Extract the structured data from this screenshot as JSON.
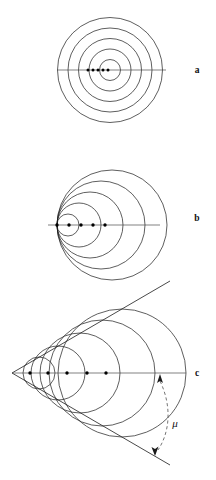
{
  "figure": {
    "background_color": "#ffffff",
    "ink_color": "#1a1a1a",
    "axis_color": "#4a4a4a",
    "width": 216,
    "height": 480
  },
  "panels": [
    {
      "id": "a",
      "label": "a",
      "label_x": 197,
      "label_y": 73,
      "caption_role": "stationary-source-subsonic-zero",
      "axis": {
        "x1": 57,
        "y1": 70,
        "x2": 166,
        "y2": 70
      },
      "center": {
        "x": 110,
        "y": 70
      },
      "circles": [
        {
          "cx": 110,
          "cy": 70,
          "r": 10.5
        },
        {
          "cx": 110,
          "cy": 70,
          "r": 21.0
        },
        {
          "cx": 110,
          "cy": 70,
          "r": 31.5
        },
        {
          "cx": 110,
          "cy": 70,
          "r": 42.0
        },
        {
          "cx": 110,
          "cy": 70,
          "r": 52.5
        }
      ],
      "source_dots": [
        {
          "cx": 88,
          "cy": 70,
          "r": 1.5
        },
        {
          "cx": 93,
          "cy": 70,
          "r": 1.5
        },
        {
          "cx": 98,
          "cy": 70,
          "r": 1.5
        },
        {
          "cx": 103,
          "cy": 70,
          "r": 1.5
        },
        {
          "cx": 108,
          "cy": 70,
          "r": 1.5
        }
      ]
    },
    {
      "id": "b",
      "label": "b",
      "label_x": 197,
      "label_y": 221,
      "caption_role": "sonic-source-mach-one",
      "axis": {
        "x1": 48,
        "y1": 225,
        "x2": 160,
        "y2": 225
      },
      "circles": [
        {
          "cx": 68,
          "cy": 225,
          "r": 11
        },
        {
          "cx": 79,
          "cy": 225,
          "r": 22
        },
        {
          "cx": 90,
          "cy": 225,
          "r": 33
        },
        {
          "cx": 101,
          "cy": 225,
          "r": 44
        },
        {
          "cx": 112,
          "cy": 225,
          "r": 55
        }
      ],
      "source_dots": [
        {
          "cx": 57,
          "cy": 225,
          "r": 1.7
        },
        {
          "cx": 69,
          "cy": 225,
          "r": 1.7
        },
        {
          "cx": 81,
          "cy": 225,
          "r": 1.7
        },
        {
          "cx": 93,
          "cy": 225,
          "r": 1.7
        },
        {
          "cx": 105,
          "cy": 225,
          "r": 1.7
        }
      ]
    },
    {
      "id": "c",
      "label": "c",
      "label_x": 197,
      "label_y": 376,
      "caption_role": "supersonic-source-mach-cone",
      "axis": {
        "x1": 12,
        "y1": 373,
        "x2": 186,
        "y2": 373
      },
      "apex": {
        "x": 12,
        "y": 373
      },
      "cone_upper_end": {
        "x": 170,
        "y": 281
      },
      "cone_lower_end": {
        "x": 170,
        "y": 465
      },
      "circles": [
        {
          "cx": 39,
          "cy": 373,
          "r": 16
        },
        {
          "cx": 58,
          "cy": 373,
          "r": 27
        },
        {
          "cx": 80,
          "cy": 373,
          "r": 40
        },
        {
          "cx": 102,
          "cy": 373,
          "r": 53
        },
        {
          "cx": 122,
          "cy": 373,
          "r": 64
        }
      ],
      "source_dots": [
        {
          "cx": 30,
          "cy": 373,
          "r": 1.7
        },
        {
          "cx": 48,
          "cy": 373,
          "r": 1.7
        },
        {
          "cx": 67,
          "cy": 373,
          "r": 1.7
        },
        {
          "cx": 87,
          "cy": 373,
          "r": 1.7
        },
        {
          "cx": 106,
          "cy": 373,
          "r": 1.7
        }
      ],
      "angle_annotation": {
        "symbol": "μ",
        "symbol_x": 175,
        "symbol_y": 425,
        "arc_path": "M 160 380 C 172 405, 170 432, 157 451",
        "arrow_up_tip": {
          "x": 160,
          "y": 374
        },
        "arrow_down_tip": {
          "x": 155,
          "y": 454
        }
      },
      "axis_end_label": "c"
    }
  ],
  "labels": {
    "panel_a": "a",
    "panel_b": "b",
    "panel_c": "c",
    "axis_c": "c",
    "mach_angle": "μ"
  }
}
